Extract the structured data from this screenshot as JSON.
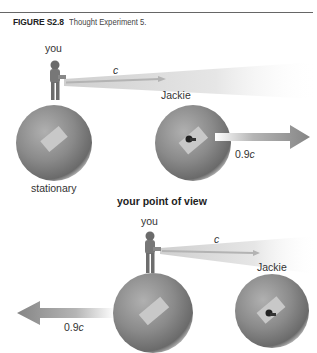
{
  "figure": {
    "number": "FIGURE S2.8",
    "title": "Thought Experiment 5."
  },
  "top_panel": {
    "you_label": "you",
    "light_label": "c",
    "jackie_label": "Jackie",
    "speed_label": "0.9c",
    "stationary_label": "stationary"
  },
  "section_heading": "your point of view",
  "bottom_panel": {
    "you_label": "you",
    "light_label": "c",
    "jackie_label": "Jackie",
    "speed_label": "0.9c"
  },
  "colors": {
    "sphere": "#8a8a8a",
    "arrow": "#8c8c8c",
    "beam": "#d8d8d8",
    "rule": "#666666"
  }
}
